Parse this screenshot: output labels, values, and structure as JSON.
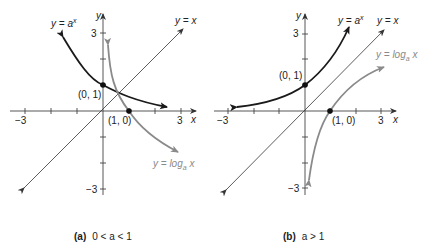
{
  "panels": [
    {
      "id": "a",
      "caption_tag": "(a)",
      "caption_cond": "0 < a < 1",
      "axis_labels": {
        "x": "x",
        "y": "y"
      },
      "ticks": {
        "x_neg": "−3",
        "x_pos": "3",
        "y_pos": "3",
        "y_neg": "−3"
      },
      "curves": {
        "exp_label": "y = a",
        "exp_sup": "x",
        "identity_label": "y = x",
        "log_label": "y = log",
        "log_sub": "a",
        "log_var": " x"
      },
      "points": {
        "p01": "(0, 1)",
        "p10": "(1, 0)"
      }
    },
    {
      "id": "b",
      "caption_tag": "(b)",
      "caption_cond": "a > 1",
      "axis_labels": {
        "x": "x",
        "y": "y"
      },
      "ticks": {
        "x_neg": "−3",
        "x_pos": "3",
        "y_pos": "3",
        "y_neg": "−3"
      },
      "curves": {
        "exp_label": "y = a",
        "exp_sup": "x",
        "identity_label": "y = x",
        "log_label": "y = log",
        "log_sub": "a",
        "log_var": " x"
      },
      "points": {
        "p01": "(0, 1)",
        "p10": "(1, 0)"
      }
    }
  ],
  "colors": {
    "exp_curve": "#1a1a1a",
    "log_curve": "#8a8a8a",
    "identity": "#333333",
    "axes": "#444444"
  }
}
